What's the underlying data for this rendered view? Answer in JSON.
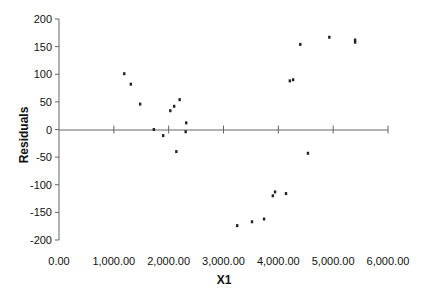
{
  "chart_data": {
    "type": "scatter",
    "title": "",
    "xlabel": "X1",
    "ylabel": "Residuals",
    "xlim": [
      0,
      6000
    ],
    "ylim": [
      -200,
      200
    ],
    "grid": false,
    "legend": null,
    "x_ticks": [
      "0.00",
      "1,000.00",
      "2,000.00",
      "3,000.00",
      "4,000.00",
      "5,000.00",
      "6,000.00"
    ],
    "x_tick_values": [
      0,
      1000,
      2000,
      3000,
      4000,
      5000,
      6000
    ],
    "y_ticks": [
      "200",
      "150",
      "100",
      "50",
      "0",
      "-50",
      "-100",
      "-150",
      "-200"
    ],
    "y_tick_values": [
      200,
      150,
      100,
      50,
      0,
      -50,
      -100,
      -150,
      -200
    ],
    "series": [
      {
        "name": "Residuals",
        "points": [
          {
            "x": 1190,
            "y": 101
          },
          {
            "x": 1310,
            "y": 82
          },
          {
            "x": 1480,
            "y": 46
          },
          {
            "x": 1730,
            "y": 0
          },
          {
            "x": 1900,
            "y": -11
          },
          {
            "x": 2030,
            "y": 34
          },
          {
            "x": 2100,
            "y": 42
          },
          {
            "x": 2200,
            "y": 54
          },
          {
            "x": 2140,
            "y": -40
          },
          {
            "x": 2320,
            "y": 12
          },
          {
            "x": 2310,
            "y": -4
          },
          {
            "x": 3250,
            "y": -174
          },
          {
            "x": 3520,
            "y": -167
          },
          {
            "x": 3740,
            "y": -162
          },
          {
            "x": 3900,
            "y": -120
          },
          {
            "x": 3940,
            "y": -113
          },
          {
            "x": 4140,
            "y": -116
          },
          {
            "x": 4210,
            "y": 88
          },
          {
            "x": 4270,
            "y": 90
          },
          {
            "x": 4400,
            "y": 154
          },
          {
            "x": 4540,
            "y": -43
          },
          {
            "x": 4930,
            "y": 167
          },
          {
            "x": 5400,
            "y": 162
          },
          {
            "x": 5400,
            "y": 158
          }
        ]
      }
    ]
  }
}
